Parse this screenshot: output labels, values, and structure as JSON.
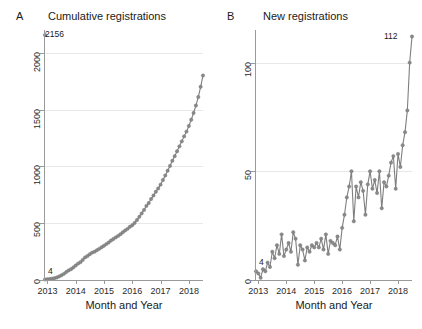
{
  "figure": {
    "background": "#ffffff",
    "series_color": "#7f7f7f",
    "grid_color": "#e8e8e8",
    "axis_color": "#9a9a9a"
  },
  "panels": [
    {
      "letter": "A",
      "title": "Cumulative registrations"
    },
    {
      "letter": "B",
      "title": "New registrations"
    }
  ],
  "axis_titles": {
    "x": "Month and Year"
  },
  "annotations": {
    "panelA_start": "4",
    "panelA_end": "2156",
    "panelB_start": "4",
    "panelB_end": "112"
  },
  "ticks": {
    "panelA_y": [
      "0",
      "500",
      "1000",
      "1500",
      "2000"
    ],
    "panelB_y": [
      "0",
      "50",
      "100"
    ],
    "x": [
      "2013",
      "2014",
      "2015",
      "2016",
      "2017",
      "2018"
    ]
  },
  "chart_data": [
    {
      "type": "line",
      "panel": "A",
      "title": "Cumulative registrations",
      "xlabel": "Month and Year",
      "ylabel": "",
      "ylim": [
        0,
        2200
      ],
      "yticks": [
        0,
        500,
        1000,
        1500,
        2000
      ],
      "xlim": [
        "2012-12",
        "2018-07"
      ],
      "xticks": [
        "2013",
        "2014",
        "2015",
        "2016",
        "2017",
        "2018"
      ],
      "grid": "horizontal",
      "markers": true,
      "annotations": [
        {
          "label": "4",
          "x": "2012-12",
          "y": 4
        },
        {
          "label": "2156",
          "x": "2018-07",
          "y": 2156
        }
      ],
      "x": [
        "2012-12",
        "2013-01",
        "2013-02",
        "2013-03",
        "2013-04",
        "2013-05",
        "2013-06",
        "2013-07",
        "2013-08",
        "2013-09",
        "2013-10",
        "2013-11",
        "2013-12",
        "2014-01",
        "2014-02",
        "2014-03",
        "2014-04",
        "2014-05",
        "2014-06",
        "2014-07",
        "2014-08",
        "2014-09",
        "2014-10",
        "2014-11",
        "2014-12",
        "2015-01",
        "2015-02",
        "2015-03",
        "2015-04",
        "2015-05",
        "2015-06",
        "2015-07",
        "2015-08",
        "2015-09",
        "2015-10",
        "2015-11",
        "2015-12",
        "2016-01",
        "2016-02",
        "2016-03",
        "2016-04",
        "2016-05",
        "2016-06",
        "2016-07",
        "2016-08",
        "2016-09",
        "2016-10",
        "2016-11",
        "2016-12",
        "2017-01",
        "2017-02",
        "2017-03",
        "2017-04",
        "2017-05",
        "2017-06",
        "2017-07",
        "2017-08",
        "2017-09",
        "2017-10",
        "2017-11",
        "2017-12",
        "2018-01",
        "2018-02",
        "2018-03",
        "2018-04",
        "2018-05",
        "2018-06",
        "2018-07"
      ],
      "values": [
        4,
        7,
        9,
        12,
        16,
        22,
        31,
        42,
        54,
        70,
        84,
        95,
        110,
        127,
        144,
        157,
        177,
        199,
        211,
        227,
        241,
        249,
        262,
        274,
        288,
        301,
        316,
        330,
        347,
        361,
        375,
        388,
        403,
        420,
        436,
        450,
        468,
        482,
        502,
        528,
        556,
        586,
        617,
        652,
        677,
        713,
        744,
        777,
        806,
        839,
        880,
        920,
        962,
        1004,
        1049,
        1090,
        1133,
        1176,
        1220,
        1264,
        1306,
        1355,
        1410,
        1470,
        1535,
        1610,
        1700,
        1800,
        2156
      ]
    },
    {
      "type": "line",
      "panel": "B",
      "title": "New registrations",
      "xlabel": "Month and Year",
      "ylabel": "",
      "ylim": [
        0,
        115
      ],
      "yticks": [
        0,
        50,
        100
      ],
      "xlim": [
        "2012-12",
        "2018-07"
      ],
      "xticks": [
        "2013",
        "2014",
        "2015",
        "2016",
        "2017",
        "2018"
      ],
      "grid": "horizontal",
      "markers": true,
      "annotations": [
        {
          "label": "4",
          "x": "2012-12",
          "y": 4
        },
        {
          "label": "112",
          "x": "2018-07",
          "y": 112
        }
      ],
      "x": [
        "2012-12",
        "2013-01",
        "2013-02",
        "2013-03",
        "2013-04",
        "2013-05",
        "2013-06",
        "2013-07",
        "2013-08",
        "2013-09",
        "2013-10",
        "2013-11",
        "2013-12",
        "2014-01",
        "2014-02",
        "2014-03",
        "2014-04",
        "2014-05",
        "2014-06",
        "2014-07",
        "2014-08",
        "2014-09",
        "2014-10",
        "2014-11",
        "2014-12",
        "2015-01",
        "2015-02",
        "2015-03",
        "2015-04",
        "2015-05",
        "2015-06",
        "2015-07",
        "2015-08",
        "2015-09",
        "2015-10",
        "2015-11",
        "2015-12",
        "2016-01",
        "2016-02",
        "2016-03",
        "2016-04",
        "2016-05",
        "2016-06",
        "2016-07",
        "2016-08",
        "2016-09",
        "2016-10",
        "2016-11",
        "2016-12",
        "2017-01",
        "2017-02",
        "2017-03",
        "2017-04",
        "2017-05",
        "2017-06",
        "2017-07",
        "2017-08",
        "2017-09",
        "2017-10",
        "2017-11",
        "2017-12",
        "2018-01",
        "2018-02",
        "2018-03",
        "2018-04",
        "2018-05",
        "2018-06",
        "2018-07"
      ],
      "values": [
        4,
        3,
        1,
        5,
        4,
        8,
        6,
        13,
        10,
        16,
        12,
        21,
        11,
        14,
        17,
        13,
        22,
        19,
        7,
        16,
        14,
        9,
        15,
        13,
        16,
        15,
        17,
        15,
        19,
        14,
        21,
        12,
        18,
        17,
        16,
        20,
        14,
        24,
        30,
        38,
        43,
        50,
        27,
        43,
        38,
        45,
        41,
        30,
        44,
        50,
        42,
        46,
        40,
        50,
        33,
        45,
        43,
        48,
        54,
        57,
        42,
        58,
        52,
        62,
        68,
        78,
        100,
        112
      ]
    }
  ]
}
